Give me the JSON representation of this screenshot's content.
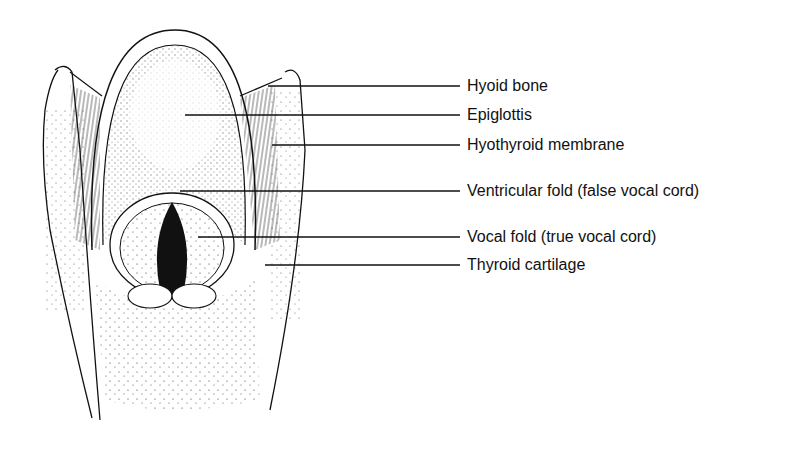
{
  "figure": {
    "labels": [
      {
        "text": "Hyoid bone",
        "y": 86,
        "line_start_x": 268
      },
      {
        "text": "Epiglottis",
        "y": 115,
        "line_start_x": 185
      },
      {
        "text": "Hyothyroid membrane",
        "y": 145,
        "line_start_x": 272
      },
      {
        "text": "Ventricular fold (false vocal cord)",
        "y": 191,
        "line_start_x": 180
      },
      {
        "text": "Vocal fold (true vocal cord)",
        "y": 237,
        "line_start_x": 198
      },
      {
        "text": "Thyroid cartilage",
        "y": 265,
        "line_start_x": 265
      }
    ],
    "colors": {
      "ink": "#111111",
      "background": "#ffffff"
    }
  }
}
